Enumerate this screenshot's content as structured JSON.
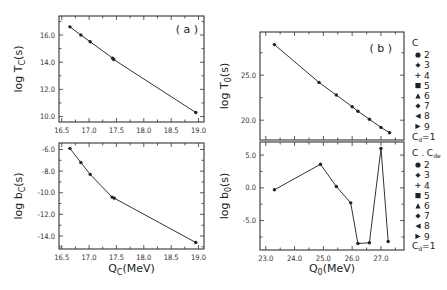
{
  "figure": {
    "panel_a_label": "( a )",
    "panel_b_label": "( b )"
  },
  "legend_top": {
    "title": "C",
    "items": [
      {
        "marker": "circle",
        "label": "2"
      },
      {
        "marker": "star",
        "label": "3"
      },
      {
        "marker": "plus",
        "label": "4"
      },
      {
        "marker": "square",
        "label": "5"
      },
      {
        "marker": "triangle-up",
        "label": "6"
      },
      {
        "marker": "diamond",
        "label": "7"
      },
      {
        "marker": "triangle-left",
        "label": "8"
      },
      {
        "marker": "triangle-right",
        "label": "9"
      }
    ],
    "footer": "Cd=1"
  },
  "legend_bottom": {
    "title": "C . Cde",
    "items": [
      {
        "marker": "circle",
        "label": "2"
      },
      {
        "marker": "star",
        "label": "3"
      },
      {
        "marker": "plus",
        "label": "4"
      },
      {
        "marker": "square",
        "label": "5"
      },
      {
        "marker": "triangle-up",
        "label": "6"
      },
      {
        "marker": "diamond",
        "label": "7"
      },
      {
        "marker": "triangle-left",
        "label": "8"
      },
      {
        "marker": "triangle-right",
        "label": "9"
      }
    ],
    "footer": "Cd=1"
  },
  "chart_data": [
    {
      "id": "a-top",
      "type": "line",
      "title": "(a)",
      "xlabel": "",
      "ylabel": "log Tc(s)",
      "xlim": [
        16.45,
        19.1
      ],
      "ylim": [
        9.6,
        17.4
      ],
      "xticks": [
        16.5,
        17.0,
        17.5,
        18.0,
        18.5,
        19.0
      ],
      "xtick_labels": [
        "16.5",
        "17.0",
        "17.5",
        "18.0",
        "18.5",
        "19.0"
      ],
      "yticks": [
        10.0,
        12.0,
        14.0,
        16.0
      ],
      "ytick_labels": [
        "10.0",
        "12.0",
        "14.0",
        "16.0"
      ],
      "x": [
        16.65,
        16.85,
        17.02,
        17.43,
        17.45,
        18.95
      ],
      "y": [
        16.6,
        16.0,
        15.5,
        14.3,
        14.2,
        10.3
      ],
      "grid": false
    },
    {
      "id": "a-bottom",
      "type": "line",
      "xlabel": "Qc(MeV)",
      "ylabel": "log bc(s)",
      "xlim": [
        16.45,
        19.1
      ],
      "ylim": [
        -15.2,
        -5.4
      ],
      "xticks": [
        16.5,
        17.0,
        17.5,
        18.0,
        18.5,
        19.0
      ],
      "xtick_labels": [
        "16.5",
        "17.0",
        "17.5",
        "18.0",
        "18.5",
        "19.0"
      ],
      "yticks": [
        -14.0,
        -12.0,
        -10.0,
        -8.0,
        -6.0
      ],
      "ytick_labels": [
        "-14.0",
        "-12.0",
        "-10.0",
        "-8.0",
        "-6.0"
      ],
      "x": [
        16.65,
        16.85,
        17.02,
        17.42,
        17.46,
        18.95
      ],
      "y": [
        -5.9,
        -7.2,
        -8.3,
        -10.4,
        -10.5,
        -14.6
      ],
      "grid": false
    },
    {
      "id": "b-top",
      "type": "line",
      "title": "(b)",
      "xlabel": "",
      "ylabel": "log To(s)",
      "xlim": [
        22.8,
        27.8
      ],
      "ylim": [
        17.8,
        29.8
      ],
      "xticks": [
        23.0,
        24.0,
        25.0,
        26.0,
        27.0
      ],
      "yticks": [
        20.0,
        25.0
      ],
      "ytick_labels": [
        "20.0",
        "25.0"
      ],
      "x": [
        23.3,
        24.85,
        25.45,
        26.0,
        26.2,
        26.6,
        27.0,
        27.3
      ],
      "y": [
        28.4,
        24.2,
        22.8,
        21.5,
        21.0,
        20.1,
        19.2,
        18.6
      ],
      "grid": false
    },
    {
      "id": "b-bottom",
      "type": "line",
      "xlabel": "Qo(MeV)",
      "ylabel": "log bo(s)",
      "xlim": [
        22.8,
        27.8
      ],
      "ylim": [
        -9.5,
        7.0
      ],
      "xticks": [
        23.0,
        24.0,
        25.0,
        26.0,
        27.0
      ],
      "xtick_labels": [
        "23.0",
        "24.0",
        "25.0",
        "26.0",
        "27.0"
      ],
      "yticks": [
        -5.0,
        0.0,
        5.0
      ],
      "ytick_labels": [
        "-5.0",
        "0.0",
        "5.0"
      ],
      "x": [
        23.3,
        24.9,
        25.45,
        25.95,
        26.2,
        26.6,
        27.0,
        27.25
      ],
      "y": [
        -0.3,
        3.6,
        0.2,
        -2.3,
        -8.5,
        -8.4,
        6.0,
        -8.2
      ],
      "grid": false
    }
  ]
}
